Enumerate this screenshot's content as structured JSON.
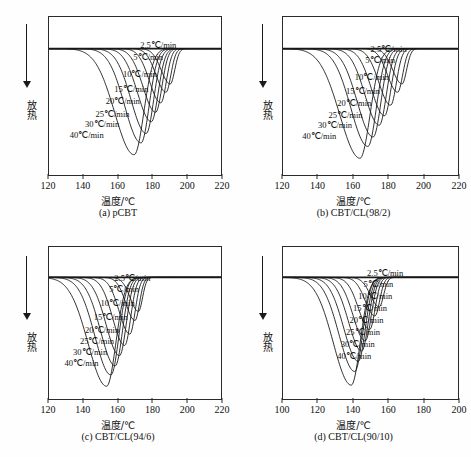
{
  "figure": {
    "axis_x_title": "温度/℃",
    "axis_y_label": "放热",
    "y_arrow_direction": "down",
    "line_color": "#1a1a1a",
    "background_color": "#ffffff"
  },
  "chart_data": [
    {
      "type": "line",
      "panel_id": "a",
      "title": "(a) pCBT",
      "xlabel": "温度/℃",
      "ylabel": "放热",
      "xlim": [
        120,
        220
      ],
      "xticks": [
        120,
        140,
        160,
        180,
        200,
        220
      ],
      "xtick_labels": [
        "120",
        "140",
        "160",
        "180",
        "200",
        "220"
      ],
      "grid": false,
      "legend_position": "inside-right",
      "series": [
        {
          "name": "2.5℃/min",
          "peak_temp": 190.5,
          "peak_depth": 0.3,
          "width": 4.2,
          "label_x": 173,
          "label_y": 24
        },
        {
          "name": "5℃/min",
          "peak_temp": 188.0,
          "peak_depth": 0.37,
          "width": 4.6,
          "label_x": 169,
          "label_y": 36
        },
        {
          "name": "10℃/min",
          "peak_temp": 185.0,
          "peak_depth": 0.46,
          "width": 5.2,
          "label_x": 163,
          "label_y": 53
        },
        {
          "name": "15℃/min",
          "peak_temp": 182.0,
          "peak_depth": 0.54,
          "width": 5.8,
          "label_x": 158,
          "label_y": 68
        },
        {
          "name": "20℃/min",
          "peak_temp": 179.5,
          "peak_depth": 0.62,
          "width": 6.4,
          "label_x": 153,
          "label_y": 80
        },
        {
          "name": "25℃/min",
          "peak_temp": 176.5,
          "peak_depth": 0.72,
          "width": 7.0,
          "label_x": 147,
          "label_y": 93
        },
        {
          "name": "30℃/min",
          "peak_temp": 173.5,
          "peak_depth": 0.8,
          "width": 7.6,
          "label_x": 141,
          "label_y": 103
        },
        {
          "name": "40℃/min",
          "peak_temp": 169.5,
          "peak_depth": 0.9,
          "width": 9.0,
          "label_x": 132,
          "label_y": 114
        }
      ]
    },
    {
      "type": "line",
      "panel_id": "b",
      "title": "(b) CBT/CL(98/2)",
      "xlabel": "温度/℃",
      "ylabel": "放热",
      "xlim": [
        120,
        220
      ],
      "xticks": [
        120,
        140,
        160,
        180,
        200,
        220
      ],
      "xtick_labels": [
        "120",
        "140",
        "160",
        "180",
        "200",
        "220"
      ],
      "grid": false,
      "legend_position": "inside-right",
      "series": [
        {
          "name": "2.5℃/min",
          "peak_temp": 188.0,
          "peak_depth": 0.3,
          "width": 4.2,
          "label_x": 170,
          "label_y": 28
        },
        {
          "name": "5℃/min",
          "peak_temp": 185.5,
          "peak_depth": 0.37,
          "width": 4.6,
          "label_x": 167,
          "label_y": 39
        },
        {
          "name": "10℃/min",
          "peak_temp": 181.5,
          "peak_depth": 0.48,
          "width": 5.3,
          "label_x": 161,
          "label_y": 56
        },
        {
          "name": "15℃/min",
          "peak_temp": 178.0,
          "peak_depth": 0.57,
          "width": 5.9,
          "label_x": 156,
          "label_y": 70
        },
        {
          "name": "20℃/min",
          "peak_temp": 175.0,
          "peak_depth": 0.65,
          "width": 6.5,
          "label_x": 151,
          "label_y": 82
        },
        {
          "name": "25℃/min",
          "peak_temp": 171.5,
          "peak_depth": 0.75,
          "width": 7.2,
          "label_x": 146,
          "label_y": 94
        },
        {
          "name": "30℃/min",
          "peak_temp": 168.5,
          "peak_depth": 0.83,
          "width": 7.8,
          "label_x": 140,
          "label_y": 104
        },
        {
          "name": "40℃/min",
          "peak_temp": 164.0,
          "peak_depth": 0.93,
          "width": 9.2,
          "label_x": 131,
          "label_y": 115
        }
      ]
    },
    {
      "type": "line",
      "panel_id": "c",
      "title": "(c) CBT/CL(94/6)",
      "xlabel": "温度/℃",
      "ylabel": "放热",
      "xlim": [
        120,
        220
      ],
      "xticks": [
        120,
        140,
        160,
        180,
        200,
        220
      ],
      "xtick_labels": [
        "120",
        "140",
        "160",
        "180",
        "200",
        "220"
      ],
      "grid": false,
      "legend_position": "inside-right",
      "series": [
        {
          "name": "2.5℃/min",
          "peak_temp": 172.0,
          "peak_depth": 0.3,
          "width": 3.8,
          "label_x": 158,
          "label_y": 27
        },
        {
          "name": "5℃/min",
          "peak_temp": 170.0,
          "peak_depth": 0.38,
          "width": 4.2,
          "label_x": 155,
          "label_y": 38
        },
        {
          "name": "10℃/min",
          "peak_temp": 167.0,
          "peak_depth": 0.5,
          "width": 4.9,
          "label_x": 150,
          "label_y": 52
        },
        {
          "name": "15℃/min",
          "peak_temp": 164.0,
          "peak_depth": 0.6,
          "width": 5.5,
          "label_x": 146,
          "label_y": 66
        },
        {
          "name": "20℃/min",
          "peak_temp": 161.0,
          "peak_depth": 0.69,
          "width": 6.2,
          "label_x": 141,
          "label_y": 79
        },
        {
          "name": "25℃/min",
          "peak_temp": 158.5,
          "peak_depth": 0.78,
          "width": 6.8,
          "label_x": 138,
          "label_y": 90
        },
        {
          "name": "30℃/min",
          "peak_temp": 156.0,
          "peak_depth": 0.86,
          "width": 7.4,
          "label_x": 134,
          "label_y": 101
        },
        {
          "name": "40℃/min",
          "peak_temp": 153.5,
          "peak_depth": 0.96,
          "width": 8.6,
          "label_x": 129,
          "label_y": 112
        }
      ]
    },
    {
      "type": "line",
      "panel_id": "d",
      "title": "(d) CBT/CL(90/10)",
      "xlabel": "温度/℃",
      "ylabel": "放热",
      "xlim": [
        100,
        200
      ],
      "xticks": [
        100,
        120,
        140,
        160,
        180,
        200
      ],
      "xtick_labels": [
        "100",
        "120",
        "140",
        "160",
        "180",
        "200"
      ],
      "grid": false,
      "legend_position": "inside-right",
      "series": [
        {
          "name": "2.5℃/min",
          "peak_temp": 155.0,
          "peak_depth": 0.26,
          "width": 4.0,
          "label_x": 148,
          "label_y": 22
        },
        {
          "name": "5℃/min",
          "peak_temp": 152.5,
          "peak_depth": 0.34,
          "width": 4.4,
          "label_x": 146,
          "label_y": 33
        },
        {
          "name": "10℃/min",
          "peak_temp": 149.5,
          "peak_depth": 0.46,
          "width": 5.0,
          "label_x": 143,
          "label_y": 45
        },
        {
          "name": "15℃/min",
          "peak_temp": 147.0,
          "peak_depth": 0.56,
          "width": 5.5,
          "label_x": 140,
          "label_y": 57
        },
        {
          "name": "20℃/min",
          "peak_temp": 145.0,
          "peak_depth": 0.65,
          "width": 6.0,
          "label_x": 138,
          "label_y": 69
        },
        {
          "name": "25℃/min",
          "peak_temp": 143.0,
          "peak_depth": 0.74,
          "width": 6.6,
          "label_x": 136,
          "label_y": 81
        },
        {
          "name": "30℃/min",
          "peak_temp": 141.0,
          "peak_depth": 0.83,
          "width": 7.2,
          "label_x": 133,
          "label_y": 93
        },
        {
          "name": "40℃/min",
          "peak_temp": 139.0,
          "peak_depth": 0.95,
          "width": 8.2,
          "label_x": 131,
          "label_y": 105
        }
      ]
    }
  ]
}
